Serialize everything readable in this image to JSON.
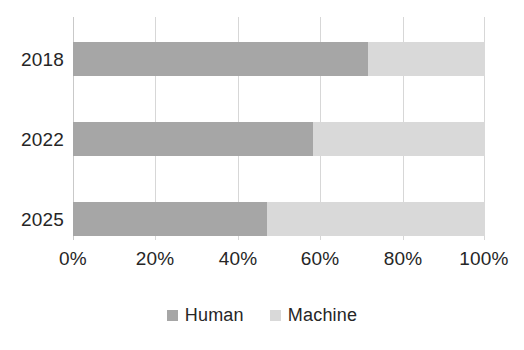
{
  "chart_data": {
    "type": "bar",
    "orientation": "horizontal",
    "stacked": true,
    "normalized": true,
    "title": "",
    "subtitle": "",
    "xlabel": "",
    "ylabel": "",
    "categories": [
      "2018",
      "2022",
      "2025"
    ],
    "series": [
      {
        "name": "Human",
        "color": "#a6a6a6",
        "values": [
          71.6,
          58.3,
          47.1
        ]
      },
      {
        "name": "Machine",
        "color": "#d9d9d9",
        "values": [
          28.4,
          41.7,
          52.9
        ]
      }
    ],
    "xlim": [
      0,
      100
    ],
    "xticks": [
      0,
      20,
      40,
      60,
      80,
      100
    ],
    "xtick_labels": [
      "0%",
      "20%",
      "40%",
      "60%",
      "80%",
      "100%"
    ],
    "grid": "vertical",
    "legend_position": "bottom",
    "legend_entries": [
      "Human",
      "Machine"
    ],
    "background_color": "#ffffff",
    "gridline_color": "#d7d7d7",
    "text_color": "#262626"
  }
}
